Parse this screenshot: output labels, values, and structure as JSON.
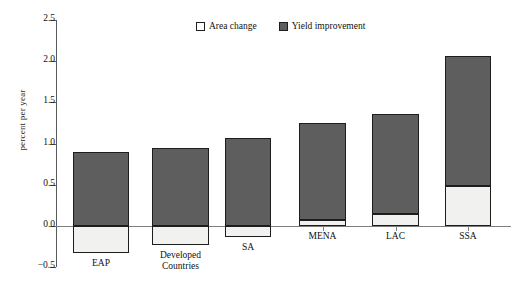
{
  "chart_data": {
    "type": "bar",
    "title": "",
    "subtitle": "",
    "xlabel": "",
    "ylabel": "percent per year",
    "ylim": [
      -0.5,
      2.5
    ],
    "yticks": [
      -0.5,
      0.0,
      0.5,
      1.0,
      1.5,
      2.0,
      2.5
    ],
    "ytick_labels": [
      "−0.5",
      "0.0",
      "0.5",
      "1.0",
      "1.5",
      "2.0",
      "2.5"
    ],
    "grid": false,
    "stacked": true,
    "legend_position": "top-center",
    "categories": [
      "EAP",
      "Developed\nCountries",
      "SA",
      "MENA",
      "LAC",
      "SSA"
    ],
    "series": [
      {
        "name": "Area change",
        "color": "#f1f1ef",
        "values": [
          -0.33,
          -0.23,
          -0.13,
          0.07,
          0.14,
          0.48
        ]
      },
      {
        "name": "Yield improvement",
        "color": "#5e5e5e",
        "values": [
          0.9,
          0.95,
          1.07,
          1.18,
          1.22,
          1.58
        ]
      }
    ],
    "bar_totals": [
      0.9,
      0.95,
      1.07,
      1.25,
      1.36,
      2.06
    ]
  },
  "legend": {
    "items": [
      {
        "label": "Area change",
        "swatch": "area-change-swatch"
      },
      {
        "label": "Yield improvement",
        "swatch": "yield-improvement-swatch"
      }
    ]
  },
  "axes": {
    "y_title": "percent per year",
    "y_ticks": [
      "2.5",
      "2.0",
      "1.5",
      "1.0",
      "0.5",
      "0.0",
      "−0.5"
    ],
    "x_categories": [
      "EAP",
      "Developed\nCountries",
      "SA",
      "MENA",
      "LAC",
      "SSA"
    ]
  },
  "colors": {
    "area_change": "#f1f1ef",
    "yield_improvement": "#5e5e5e",
    "axis": "#5a5a5a",
    "outline": "#1d1d1d",
    "background": "#ffffff"
  }
}
